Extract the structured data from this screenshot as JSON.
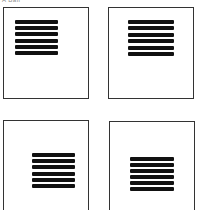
{
  "caption": "A  Ball",
  "pages": [
    {
      "id": "top-left",
      "box": {
        "left": 3,
        "top": 7,
        "width": 86,
        "height": 92
      },
      "text_block": {
        "left": 15,
        "top": 20,
        "width": 43,
        "height": 35
      },
      "line_count": 6
    },
    {
      "id": "top-right",
      "box": {
        "left": 108,
        "top": 7,
        "width": 86,
        "height": 92
      },
      "text_block": {
        "left": 128,
        "top": 20,
        "width": 46,
        "height": 36
      },
      "line_count": 6
    },
    {
      "id": "bottom-left",
      "box": {
        "left": 3,
        "top": 120,
        "width": 86,
        "height": 95
      },
      "text_block": {
        "left": 32,
        "top": 153,
        "width": 43,
        "height": 35
      },
      "line_count": 6
    },
    {
      "id": "bottom-right",
      "box": {
        "left": 109,
        "top": 121,
        "width": 86,
        "height": 95
      },
      "text_block": {
        "left": 130,
        "top": 157,
        "width": 44,
        "height": 34
      },
      "line_count": 6
    }
  ],
  "colors": {
    "border": "#333333",
    "text_line": "#111111",
    "background": "#ffffff"
  }
}
